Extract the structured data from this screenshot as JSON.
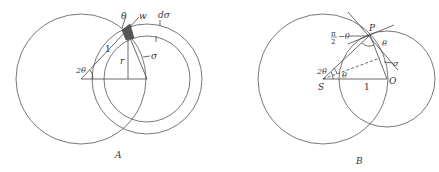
{
  "figure_a": {
    "caption": "A",
    "labels": {
      "theta": "θ",
      "w": "w",
      "d_sigma": "dσ",
      "one": "1",
      "r": "r",
      "sigma": "σ",
      "two_theta": "2θ"
    }
  },
  "figure_b": {
    "caption": "B",
    "labels": {
      "P": "P",
      "pi": "π",
      "two": "2",
      "minus_theta": "−θ",
      "theta_right": "θ",
      "sigma": "σ",
      "two_theta": "2θ",
      "theta_inner": "θ",
      "S": "S",
      "one": "1",
      "O": "O"
    }
  },
  "colors": {
    "stroke": "#555555",
    "text": "#333333",
    "background": "#ffffff"
  }
}
